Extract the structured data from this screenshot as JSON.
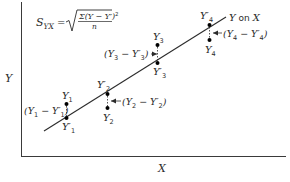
{
  "diagram": {
    "axes": {
      "x_label": "X",
      "y_label": "Y"
    },
    "formula": {
      "lhs": "S",
      "lhs_sub": "YX",
      "equals": "=",
      "numerator": "Σ(Y − Y′)",
      "numerator_exp": "2",
      "denominator": "n"
    },
    "regression_line": {
      "label_y": "Y",
      "label_on": "on",
      "label_x": "X"
    },
    "points": [
      {
        "observed": "Y",
        "observed_sub": "1",
        "predicted": "Y′",
        "predicted_sub": "1",
        "deviation": "(Y",
        "deviation_sub1": "1",
        "deviation_mid": " − Y′",
        "deviation_sub2": "1",
        "deviation_end": ")"
      },
      {
        "observed": "Y",
        "observed_sub": "2",
        "predicted": "Y′",
        "predicted_sub": "2",
        "deviation": "(Y",
        "deviation_sub1": "2",
        "deviation_mid": " − Y′",
        "deviation_sub2": "2",
        "deviation_end": ")"
      },
      {
        "observed": "Y",
        "observed_sub": "3",
        "predicted": "Y′",
        "predicted_sub": "3",
        "deviation": "(Y",
        "deviation_sub1": "3",
        "deviation_mid": " − Y′",
        "deviation_sub2": "3",
        "deviation_end": ")"
      },
      {
        "observed": "Y",
        "observed_sub": "4",
        "predicted": "Y′",
        "predicted_sub": "4",
        "deviation": "(Y",
        "deviation_sub1": "4",
        "deviation_mid": " − Y′",
        "deviation_sub2": "4",
        "deviation_end": ")"
      }
    ],
    "colors": {
      "ink": "#2b2b2b",
      "background": "#ffffff"
    }
  }
}
